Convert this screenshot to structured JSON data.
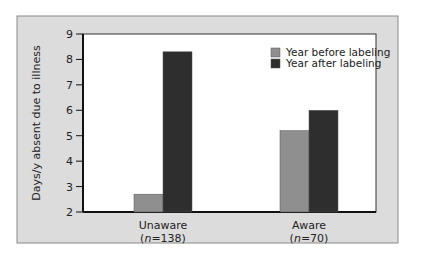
{
  "chart_data": {
    "type": "bar",
    "title": "",
    "xlabel": "",
    "ylabel": "Days/y absent due to illness",
    "ylim": [
      2,
      9
    ],
    "yticks": [
      2,
      3,
      4,
      5,
      6,
      7,
      8,
      9
    ],
    "categories": [
      "Unaware",
      "Aware"
    ],
    "category_sublabels": [
      "(n=138)",
      "(n=70)"
    ],
    "series": [
      {
        "name": "Year before labeling",
        "color": "#8f8f8f",
        "values": [
          2.7,
          5.2
        ]
      },
      {
        "name": "Year after labeling",
        "color": "#2e2e2e",
        "values": [
          8.3,
          6.0
        ]
      }
    ],
    "legend_position": "upper right",
    "grid": false
  },
  "colors": {
    "panel_background": "#dcdcdc",
    "plot_background": "#ffffff",
    "axis": "#111111"
  }
}
